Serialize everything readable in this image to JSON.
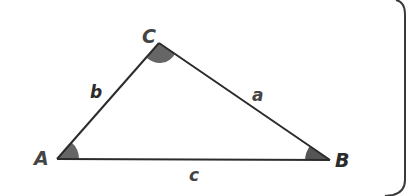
{
  "diagram": {
    "type": "triangle",
    "vertices": {
      "A": {
        "label": "A",
        "x": 57,
        "y": 159
      },
      "B": {
        "label": "B",
        "x": 330,
        "y": 160
      },
      "C": {
        "label": "C",
        "x": 159,
        "y": 43
      }
    },
    "sides": {
      "a": {
        "label": "a",
        "between": [
          "B",
          "C"
        ]
      },
      "b": {
        "label": "b",
        "between": [
          "A",
          "C"
        ]
      },
      "c": {
        "label": "c",
        "between": [
          "A",
          "B"
        ]
      }
    },
    "angle_marks": [
      "A",
      "B",
      "C"
    ],
    "colors": {
      "line": "#2b2b2b",
      "angle_fill": "#666666",
      "label": "#2b2b2b",
      "label_vertex": "#444444",
      "frame": "#3a3a3a"
    }
  }
}
